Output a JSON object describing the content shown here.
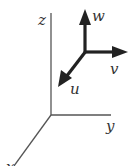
{
  "diagram": {
    "type": "3d-coordinate-axes",
    "axes": {
      "z": {
        "label": "z",
        "from": [
          51,
          115
        ],
        "to": [
          51,
          13
        ]
      },
      "y": {
        "label": "y",
        "from": [
          51,
          115
        ],
        "to": [
          111,
          115
        ]
      },
      "x": {
        "label": "x",
        "from": [
          51,
          115
        ],
        "to": [
          14,
          166
        ]
      }
    },
    "vectors": {
      "origin": [
        85,
        52
      ],
      "w": {
        "label": "w",
        "tip": [
          85,
          10
        ]
      },
      "v": {
        "label": "v",
        "tip": [
          127,
          52
        ]
      },
      "u": {
        "label": "u",
        "tip": [
          59,
          85
        ]
      }
    },
    "colors": {
      "axis": "#555555",
      "vector": "#222222",
      "label": "#333333"
    }
  }
}
